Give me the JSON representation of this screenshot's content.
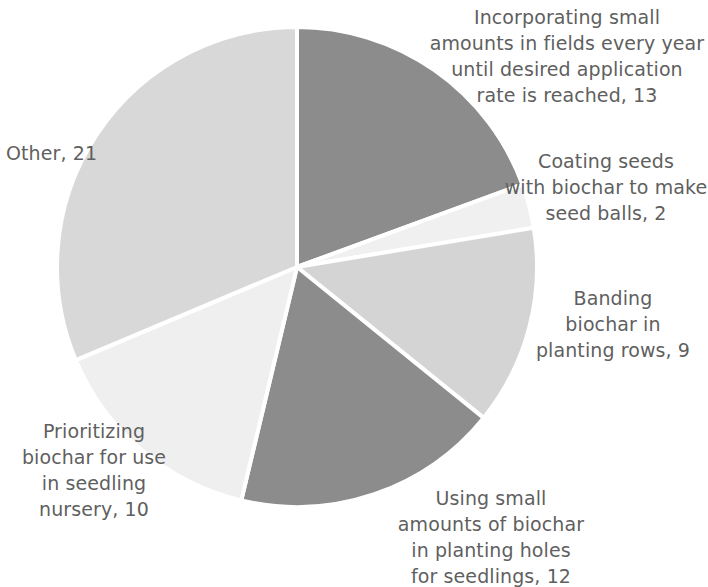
{
  "chart_data": {
    "type": "pie",
    "title": "",
    "subtitle": "",
    "xlabel": "",
    "ylabel": "",
    "total": 67,
    "legend_position": "none",
    "grid": false,
    "label_format": "category, value",
    "start_angle_deg": 0,
    "direction": "clockwise",
    "categories": [
      "Incorporating small amounts in fields every year until desired application rate is reached",
      "Coating seeds with biochar to make seed balls",
      "Banding biochar in planting rows",
      "Using small amounts of biochar in planting holes for seedlings",
      "Prioritizing biochar for use in seedling nursery",
      "Other"
    ],
    "values": [
      13,
      2,
      9,
      12,
      10,
      21
    ],
    "colors": [
      "#8c8c8c",
      "#f0f0f0",
      "#d4d4d4",
      "#8c8c8c",
      "#efefef",
      "#d8d8d8"
    ],
    "slices": [
      {
        "name": "incorporating-small-amounts",
        "label": "Incorporating small\namounts in fields every year\nuntil desired application\nrate is reached, 13",
        "category": "Incorporating small amounts in fields every year until desired application rate is reached",
        "value": 13,
        "percent": 19.4,
        "color": "#8c8c8c",
        "start_deg": 0,
        "end_deg": 69.85
      },
      {
        "name": "coating-seeds",
        "label": "Coating seeds\nwith biochar to make\nseed balls, 2",
        "category": "Coating seeds with biochar to make seed balls",
        "value": 2,
        "percent": 3.0,
        "color": "#f0f0f0",
        "start_deg": 69.85,
        "end_deg": 80.6
      },
      {
        "name": "banding-biochar",
        "label": "Banding\nbiochar in\nplanting rows, 9",
        "category": "Banding biochar in planting rows",
        "value": 9,
        "percent": 13.4,
        "color": "#d4d4d4",
        "start_deg": 80.6,
        "end_deg": 128.96
      },
      {
        "name": "using-small-amounts-planting-holes",
        "label": "Using small\namounts of biochar\nin planting holes\nfor seedlings, 12",
        "category": "Using small amounts of biochar in planting holes for seedlings",
        "value": 12,
        "percent": 17.9,
        "color": "#8c8c8c",
        "start_deg": 128.96,
        "end_deg": 193.43
      },
      {
        "name": "prioritizing-seedling-nursery",
        "label": "Prioritizing\nbiochar for use\nin seedling\nnursery, 10",
        "category": "Prioritizing biochar for use in seedling nursery",
        "value": 10,
        "percent": 14.9,
        "color": "#efefef",
        "start_deg": 193.43,
        "end_deg": 247.16
      },
      {
        "name": "other",
        "label": "Other, 21",
        "category": "Other",
        "value": 21,
        "percent": 31.3,
        "color": "#d8d8d8",
        "start_deg": 247.16,
        "end_deg": 360
      }
    ],
    "geometry": {
      "center_x": 297,
      "center_y": 267,
      "radius": 240,
      "separator_color": "#ffffff",
      "separator_width": 4
    },
    "background_color": "#ffffff",
    "text_color": "#5f5f5f"
  }
}
